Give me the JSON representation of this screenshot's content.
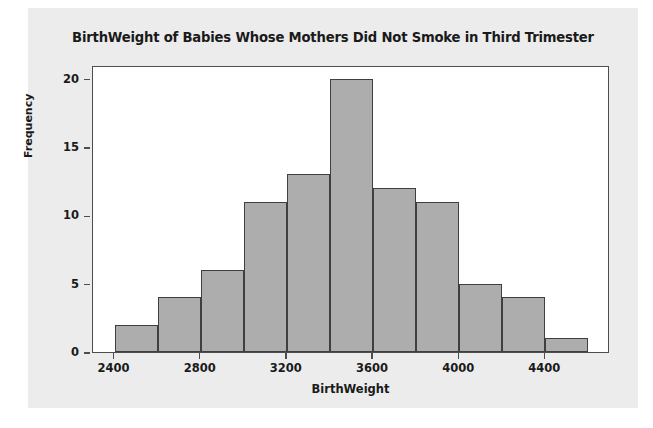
{
  "chart_data": {
    "type": "bar",
    "title": "BirthWeight of Babies Whose Mothers Did Not Smoke in Third Trimester",
    "xlabel": "BirthWeight",
    "ylabel": "Frequency",
    "bin_width": 200,
    "bin_starts": [
      2400,
      2600,
      2800,
      3000,
      3200,
      3400,
      3600,
      3800,
      4000,
      4200,
      4400
    ],
    "categories": [
      "2400-2600",
      "2600-2800",
      "2800-3000",
      "3000-3200",
      "3200-3400",
      "3400-3600",
      "3600-3800",
      "3800-4000",
      "4000-4200",
      "4200-4400",
      "4400-4600"
    ],
    "values": [
      2,
      4,
      6,
      11,
      13,
      20,
      12,
      11,
      5,
      4,
      1
    ],
    "xlim": [
      2300,
      4700
    ],
    "ylim": [
      0,
      21
    ],
    "x_ticks": [
      2400,
      2800,
      3200,
      3600,
      4000,
      4400
    ],
    "x_tick_labels": [
      "2400",
      "2800",
      "3200",
      "3600",
      "4000",
      "4400"
    ],
    "y_ticks": [
      0,
      5,
      10,
      15,
      20
    ],
    "y_tick_labels": [
      "0",
      "5",
      "10",
      "15",
      "20"
    ],
    "grid": false,
    "legend": false,
    "bar_fill_color": "#adadad",
    "bar_edge_color": "#3f3f3f",
    "plot_background_color": "#ffffff",
    "figure_background_color": "#ececec"
  }
}
